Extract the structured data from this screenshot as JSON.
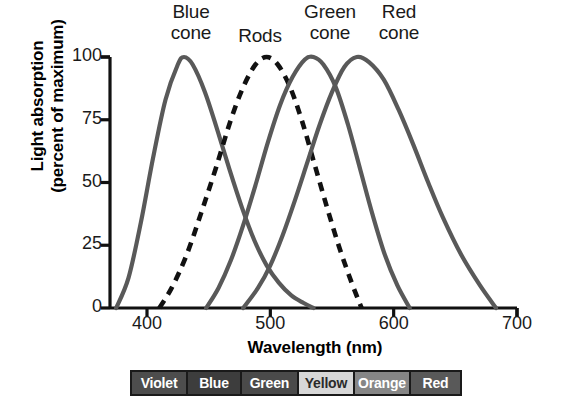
{
  "chart_data": {
    "type": "line",
    "title": "",
    "xlabel": "Wavelength (nm)",
    "ylabel": "Light absorption\n(percent of maximum)",
    "xlim": [
      370,
      700
    ],
    "ylim": [
      0,
      100
    ],
    "xticks": [
      400,
      500,
      600,
      700
    ],
    "yticks": [
      0,
      25,
      50,
      75,
      100
    ],
    "grid": false,
    "legend_position": "above-curves",
    "series": [
      {
        "name": "Blue cone",
        "peak_nm": 430,
        "style": "solid",
        "color": "#595959",
        "x": [
          375,
          385,
          395,
          405,
          415,
          425,
          430,
          437,
          447,
          457,
          467,
          477,
          487,
          497,
          507,
          517,
          527,
          535
        ],
        "values": [
          0,
          12,
          34,
          60,
          83,
          97,
          100,
          97,
          86,
          71,
          55,
          40,
          27,
          17,
          10,
          5,
          2,
          0
        ]
      },
      {
        "name": "Rods",
        "peak_nm": 497,
        "style": "dashed",
        "color": "#111111",
        "x": [
          410,
          420,
          432,
          444,
          456,
          468,
          478,
          488,
          497,
          506,
          516,
          526,
          536,
          546,
          556,
          566,
          574
        ],
        "values": [
          0,
          8,
          21,
          38,
          56,
          75,
          88,
          97,
          100,
          97,
          88,
          74,
          57,
          40,
          24,
          10,
          0
        ]
      },
      {
        "name": "Green cone",
        "peak_nm": 535,
        "style": "solid",
        "color": "#595959",
        "x": [
          448,
          458,
          468,
          478,
          488,
          498,
          508,
          518,
          528,
          535,
          543,
          553,
          563,
          573,
          583,
          593,
          603,
          613
        ],
        "values": [
          0,
          8,
          19,
          33,
          49,
          66,
          81,
          92,
          99,
          100,
          97,
          88,
          73,
          55,
          37,
          21,
          9,
          0
        ]
      },
      {
        "name": "Red cone",
        "peak_nm": 570,
        "style": "solid",
        "color": "#595959",
        "x": [
          478,
          490,
          500,
          510,
          520,
          530,
          540,
          550,
          560,
          570,
          580,
          592,
          604,
          616,
          628,
          640,
          655,
          670,
          683
        ],
        "values": [
          0,
          8,
          17,
          29,
          43,
          58,
          73,
          86,
          96,
          100,
          98,
          91,
          79,
          65,
          50,
          36,
          21,
          9,
          0
        ]
      }
    ],
    "spectrum_bands": [
      {
        "label": "Violet",
        "swatch_color": "#4d4d4d",
        "text_color": "#ffffff",
        "width_pct": 17.0
      },
      {
        "label": "Blue",
        "swatch_color": "#3d3d3d",
        "text_color": "#ffffff",
        "width_pct": 16.3
      },
      {
        "label": "Green",
        "swatch_color": "#4a4a4a",
        "text_color": "#ffffff",
        "width_pct": 17.3
      },
      {
        "label": "Yellow",
        "swatch_color": "#d7d7d7",
        "text_color": "#2a2a2a",
        "width_pct": 17.0
      },
      {
        "label": "Orange",
        "swatch_color": "#868686",
        "text_color": "#ffffff",
        "width_pct": 17.0
      },
      {
        "label": "Red",
        "swatch_color": "#595959",
        "text_color": "#ffffff",
        "width_pct": 15.4
      }
    ]
  },
  "labels": {
    "blue_cone": "Blue\ncone",
    "rods": "Rods",
    "green_cone": "Green\ncone",
    "red_cone": "Red\ncone"
  },
  "axis": {
    "x_title": "Wavelength (nm)",
    "y_title": "Light absorption\n(percent of maximum)",
    "y_ticks": [
      "100",
      "75",
      "50",
      "25",
      "0"
    ],
    "x_ticks": [
      "400",
      "500",
      "600",
      "700"
    ]
  },
  "colors": {
    "curve": "#595959",
    "rods_curve": "#111111",
    "axis": "#111111",
    "text": "#1a1a1a"
  }
}
